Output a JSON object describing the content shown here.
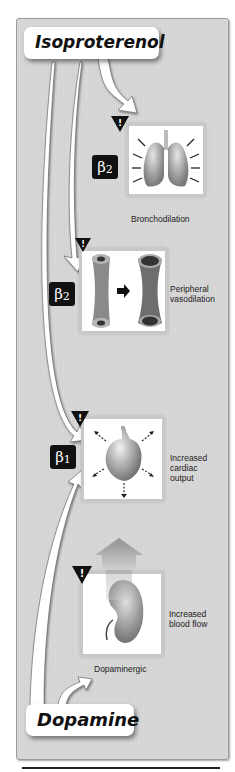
{
  "drugs": {
    "top": "Isoproterenol",
    "bottom": "Dopamine"
  },
  "effects": [
    {
      "receptor_symbol": "β",
      "receptor_sub": "2",
      "label": "Bronchodilation",
      "icon": "lungs-icon"
    },
    {
      "receptor_symbol": "β",
      "receptor_sub": "2",
      "label_lines": [
        "Peripheral",
        "vasodilation"
      ],
      "icon": "blood-vessel-icon"
    },
    {
      "receptor_symbol": "β",
      "receptor_sub": "1",
      "label_lines": [
        "Increased",
        "cardiac",
        "output"
      ],
      "icon": "heart-icon"
    },
    {
      "receptor_label": "Dopaminergic",
      "label_lines": [
        "Increased",
        "blood flow"
      ],
      "icon": "kidney-icon"
    }
  ],
  "warning_glyph": "!",
  "colors": {
    "panel_bg": "#d6d6d6",
    "receptor_bg": "#111111",
    "box_border": "#c8c8c8",
    "arrow_fill": "#ffffff"
  }
}
